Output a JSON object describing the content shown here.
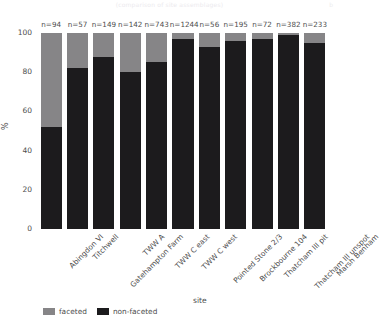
{
  "caption": {
    "top_text": "(comparison of site assemblages)",
    "top_right": "b"
  },
  "axes": {
    "y_title": "%",
    "x_title": "site",
    "y_ticks": [
      "0",
      "20",
      "40",
      "60",
      "80",
      "100"
    ],
    "y_min": 0,
    "y_max": 100
  },
  "legend": {
    "title": "",
    "items": [
      {
        "label": "faceted",
        "color": "#868587"
      },
      {
        "label": "non-faceted",
        "color": "#1c1b1d"
      }
    ]
  },
  "chart_data": {
    "type": "bar",
    "subtype": "stacked-100-percent",
    "title": "",
    "subtitle": "",
    "xlabel": "site",
    "ylabel": "%",
    "ylim": [
      0,
      100
    ],
    "yticks": [
      0,
      20,
      40,
      60,
      80,
      100
    ],
    "grid": false,
    "legend_position": "bottom",
    "categories": [
      "Abingdon VI",
      "Titchwell",
      "Gatehampton Farm",
      "TWW A",
      "TWW C east",
      "TWW C west",
      "Pointed Stone 2/3",
      "Brockbourne 104",
      "Thatcham III pit",
      "Thatcham III unspot",
      "Marsh Benham"
    ],
    "annotations": [
      "n=94",
      "n=57",
      "n=149",
      "n=142",
      "n=743",
      "n=1244",
      "n=56",
      "n=195",
      "n=72",
      "n=382",
      "n=233"
    ],
    "sample_sizes": [
      94,
      57,
      149,
      142,
      743,
      1244,
      56,
      195,
      72,
      382,
      233
    ],
    "series": [
      {
        "name": "non-faceted",
        "color": "#1c1b1d",
        "values": [
          52,
          82,
          88,
          80,
          85,
          97,
          93,
          96,
          97,
          99,
          95
        ]
      },
      {
        "name": "faceted",
        "color": "#868587",
        "values": [
          48,
          18,
          12,
          20,
          15,
          3,
          7,
          4,
          3,
          1,
          5
        ]
      }
    ]
  }
}
